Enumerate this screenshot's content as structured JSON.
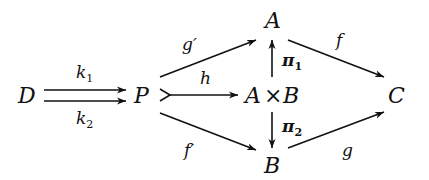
{
  "diagram": {
    "type": "commutative-diagram",
    "nodes": {
      "D": {
        "label": "D",
        "x": 28,
        "y": 103
      },
      "P": {
        "label": "P",
        "x": 143,
        "y": 103
      },
      "A": {
        "label": "A",
        "x": 274,
        "y": 28
      },
      "AxB_left": {
        "label": "A",
        "x": 254,
        "y": 103
      },
      "AxB_times": {
        "label": "×",
        "x": 273,
        "y": 103
      },
      "AxB_right": {
        "label": "B",
        "x": 291,
        "y": 103
      },
      "B": {
        "label": "B",
        "x": 273,
        "y": 172
      },
      "C": {
        "label": "C",
        "x": 398,
        "y": 103
      }
    },
    "edges": [
      {
        "id": "k1",
        "from": "D",
        "to": "P",
        "label": "k",
        "sub": "1",
        "style": "parallel-upper"
      },
      {
        "id": "k2",
        "from": "D",
        "to": "P",
        "label": "k",
        "sub": "2",
        "style": "parallel-lower"
      },
      {
        "id": "g_prime",
        "from": "P",
        "to": "A",
        "label": "g′"
      },
      {
        "id": "h",
        "from": "P",
        "to": "A×B",
        "label": "h",
        "style": "monomorphism"
      },
      {
        "id": "f_prime",
        "from": "P",
        "to": "B",
        "label": "f′"
      },
      {
        "id": "pi1",
        "from": "A×B",
        "to": "A",
        "label": "π",
        "sub": "1",
        "bold": true
      },
      {
        "id": "pi2",
        "from": "A×B",
        "to": "B",
        "label": "π",
        "sub": "2",
        "bold": true
      },
      {
        "id": "f",
        "from": "A",
        "to": "C",
        "label": "f"
      },
      {
        "id": "g",
        "from": "B",
        "to": "C",
        "label": "g"
      }
    ]
  },
  "labels": {
    "D": "D",
    "P": "P",
    "A": "A",
    "AxB_A": "A",
    "AxB_times": "×",
    "AxB_B": "B",
    "B": "B",
    "C": "C",
    "k1": "k",
    "k1_sub": "1",
    "k2": "k",
    "k2_sub": "2",
    "g_prime": "g′",
    "h": "h",
    "f_prime": "f′",
    "pi1": "π",
    "pi1_sub": "1",
    "pi2": "π",
    "pi2_sub": "2",
    "f": "f",
    "g": "g"
  }
}
